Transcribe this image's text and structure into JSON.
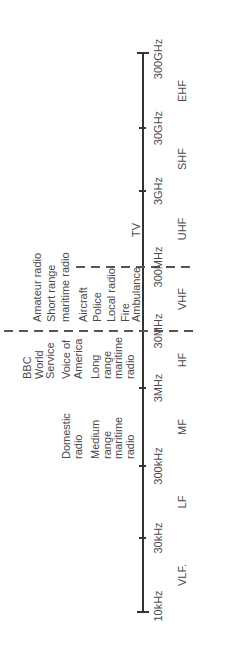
{
  "diagram": {
    "axis": {
      "ticks": [
        {
          "label": "10kHz",
          "x": 37
        },
        {
          "label": "30kHz",
          "x": 111
        },
        {
          "label": "300kHz",
          "x": 183
        },
        {
          "label": "3MHz",
          "x": 261
        },
        {
          "label": "30MHz",
          "x": 318
        },
        {
          "label": "300MHz",
          "x": 382
        },
        {
          "label": "3GHz",
          "x": 458
        },
        {
          "label": "30GHz",
          "x": 521
        },
        {
          "label": "300GHz",
          "x": 596
        }
      ]
    },
    "bands": [
      {
        "label": "VLF.",
        "x": 74
      },
      {
        "label": "LF",
        "x": 147
      },
      {
        "label": "MF",
        "x": 222
      },
      {
        "label": "HF",
        "x": 289
      },
      {
        "label": "VHF",
        "x": 350
      },
      {
        "label": "UHF",
        "x": 420
      },
      {
        "label": "SHF",
        "x": 490
      },
      {
        "label": "EHF",
        "x": 558
      }
    ],
    "uses": {
      "mf": [
        {
          "text": "Domestic\nradio"
        },
        {
          "text": "Medium\nrange\nmaritime\nradio"
        }
      ],
      "hf": [
        {
          "text": "BBC\nWorld\nService"
        },
        {
          "text": "Voice of\nAmerica"
        },
        {
          "text": "Long\nrange\nmaritime\nradio"
        }
      ],
      "vhf": [
        {
          "text": "Amateur radio"
        },
        {
          "text": "Short range"
        },
        {
          "text": "maritime radio"
        },
        {
          "text": "Aircraft"
        },
        {
          "text": "Police"
        },
        {
          "text": "Local radio"
        },
        {
          "text": "Fire"
        },
        {
          "text": "Ambulance"
        }
      ],
      "uhf": [
        {
          "text": "TV"
        }
      ]
    }
  }
}
